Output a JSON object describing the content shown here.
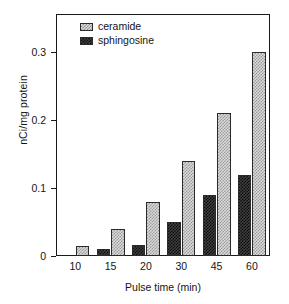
{
  "chart_data": {
    "type": "bar",
    "title": "",
    "subtitle": "",
    "xlabel": "Pulse time (min)",
    "ylabel": "nCi/mg protein",
    "categories": [
      "10",
      "15",
      "20",
      "30",
      "45",
      "60"
    ],
    "series": [
      {
        "name": "sphingosine",
        "color": "#3f3f3f",
        "pattern": "dark-checker",
        "values": [
          0.0,
          0.01,
          0.016,
          0.05,
          0.09,
          0.12
        ]
      },
      {
        "name": "ceramide",
        "color": "#d9d9d9",
        "pattern": "light-checker",
        "values": [
          0.015,
          0.04,
          0.08,
          0.14,
          0.21,
          0.301
        ]
      }
    ],
    "ylim": [
      0,
      0.355
    ],
    "yticks": [
      "0",
      "0.1",
      "0.2",
      "0.3"
    ],
    "ytick_values": [
      0,
      0.1,
      0.2,
      0.3
    ],
    "grid": false,
    "legend_position": "top-left",
    "legend_entries": [
      "ceramide",
      "sphingosine"
    ]
  },
  "axes": {
    "y_title": "nCi/mg protein",
    "x_title": "Pulse time (min)"
  },
  "legend": {
    "items": [
      {
        "label": "ceramide"
      },
      {
        "label": "sphingosine"
      }
    ]
  }
}
